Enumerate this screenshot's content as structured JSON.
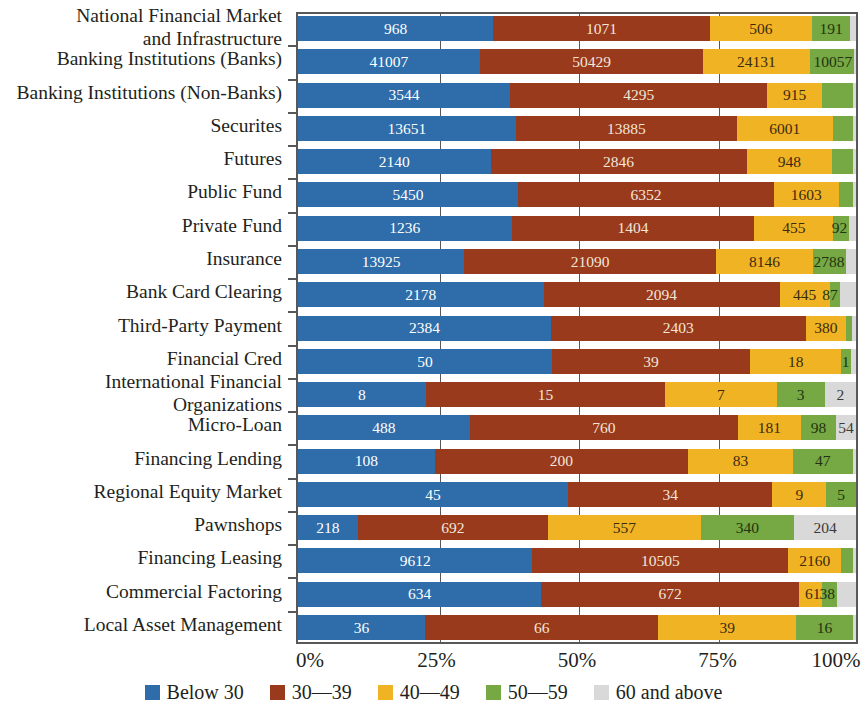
{
  "chart_data": {
    "type": "bar",
    "orientation": "horizontal",
    "stacked": true,
    "normalized": true,
    "title": "",
    "xlabel": "",
    "ylabel": "",
    "xlim": [
      0,
      100
    ],
    "xticks": [
      "0%",
      "25%",
      "50%",
      "75%",
      "100%"
    ],
    "xtick_values": [
      0,
      25,
      50,
      75,
      100
    ],
    "grid": true,
    "legend_position": "bottom",
    "legend": [
      "Below 30",
      "30—39",
      "40—49",
      "50—59",
      "60 and above"
    ],
    "colors": [
      "#2e6daa",
      "#983a1b",
      "#f0b323",
      "#76a943",
      "#d9d9d9"
    ],
    "categories": [
      "National Financial Market and Infrastructure",
      "Banking Institutions (Banks)",
      "Banking Institutions (Non-Banks)",
      "Securites",
      "Futures",
      "Public Fund",
      "Private Fund",
      "Insurance",
      "Bank Card Clearing",
      "Third-Party Payment",
      "Financial Cred",
      "International Financial Organizations",
      "Micro-Loan",
      "Financing Lending",
      "Regional Equity Market",
      "Pawnshops",
      "Financing Leasing",
      "Commercial Factoring",
      "Local Asset Management"
    ],
    "series": [
      {
        "name": "Below 30",
        "color": "#2e6daa",
        "values": [
          968,
          41007,
          3544,
          13651,
          2140,
          5450,
          1236,
          13925,
          2178,
          2384,
          50,
          8,
          488,
          108,
          45,
          218,
          9612,
          634,
          36
        ]
      },
      {
        "name": "30—39",
        "color": "#983a1b",
        "values": [
          1071,
          50429,
          4295,
          13885,
          2846,
          6352,
          1404,
          21090,
          2094,
          2403,
          39,
          15,
          760,
          200,
          34,
          692,
          10505,
          672,
          66
        ]
      },
      {
        "name": "40—49",
        "color": "#f0b323",
        "values": [
          506,
          24131,
          915,
          6001,
          948,
          1603,
          455,
          8146,
          445,
          380,
          18,
          7,
          181,
          83,
          9,
          557,
          2160,
          61,
          39
        ]
      },
      {
        "name": "50—59",
        "color": "#76a943",
        "values": [
          191,
          10057,
          230,
          1100,
          150,
          180,
          92,
          2788,
          87,
          60,
          1,
          3,
          98,
          47,
          5,
          340,
          280,
          38,
          16
        ]
      },
      {
        "name": "60 and above",
        "color": "#d9d9d9",
        "values": [
          0,
          0,
          0,
          0,
          0,
          0,
          40,
          0,
          0,
          0,
          0,
          2,
          54,
          0,
          0,
          204,
          0,
          8,
          0
        ]
      }
    ],
    "rows": [
      {
        "label_lines": [
          "National Financial Market",
          "and Infrastructure"
        ],
        "segments": [
          {
            "pct": 35.0,
            "label": "968",
            "cls": "s0"
          },
          {
            "pct": 38.8,
            "label": "1071",
            "cls": "s1"
          },
          {
            "pct": 18.3,
            "label": "506",
            "cls": "s2"
          },
          {
            "pct": 6.9,
            "label": "191",
            "cls": "s3"
          },
          {
            "pct": 1.0,
            "label": "",
            "cls": "s4"
          }
        ]
      },
      {
        "label_lines": [
          "Banking Institutions (Banks)"
        ],
        "segments": [
          {
            "pct": 32.6,
            "label": "41007",
            "cls": "s0"
          },
          {
            "pct": 40.0,
            "label": "50429",
            "cls": "s1"
          },
          {
            "pct": 19.1,
            "label": "24131",
            "cls": "s2"
          },
          {
            "pct": 8.0,
            "label": "10057",
            "cls": "s3",
            "outside": true
          },
          {
            "pct": 0.3,
            "label": "",
            "cls": "s4"
          }
        ]
      },
      {
        "label_lines": [
          "Banking Institutions (Non-Banks)"
        ],
        "segments": [
          {
            "pct": 38.0,
            "label": "3544",
            "cls": "s0"
          },
          {
            "pct": 46.1,
            "label": "4295",
            "cls": "s1"
          },
          {
            "pct": 9.8,
            "label": "915",
            "cls": "s2"
          },
          {
            "pct": 5.6,
            "label": "",
            "cls": "s3"
          },
          {
            "pct": 0.5,
            "label": "",
            "cls": "s4"
          }
        ]
      },
      {
        "label_lines": [
          "Securites"
        ],
        "segments": [
          {
            "pct": 39.0,
            "label": "13651",
            "cls": "s0"
          },
          {
            "pct": 39.7,
            "label": "13885",
            "cls": "s1"
          },
          {
            "pct": 17.1,
            "label": "6001",
            "cls": "s2"
          },
          {
            "pct": 3.7,
            "label": "",
            "cls": "s3"
          },
          {
            "pct": 0.5,
            "label": "",
            "cls": "s4"
          }
        ]
      },
      {
        "label_lines": [
          "Futures"
        ],
        "segments": [
          {
            "pct": 34.5,
            "label": "2140",
            "cls": "s0"
          },
          {
            "pct": 45.9,
            "label": "2846",
            "cls": "s1"
          },
          {
            "pct": 15.3,
            "label": "948",
            "cls": "s2"
          },
          {
            "pct": 3.8,
            "label": "",
            "cls": "s3"
          },
          {
            "pct": 0.5,
            "label": "",
            "cls": "s4"
          }
        ]
      },
      {
        "label_lines": [
          "Public Fund"
        ],
        "segments": [
          {
            "pct": 39.4,
            "label": "5450",
            "cls": "s0"
          },
          {
            "pct": 45.9,
            "label": "6352",
            "cls": "s1"
          },
          {
            "pct": 11.6,
            "label": "1603",
            "cls": "s2"
          },
          {
            "pct": 2.6,
            "label": "",
            "cls": "s3"
          },
          {
            "pct": 0.5,
            "label": "",
            "cls": "s4"
          }
        ]
      },
      {
        "label_lines": [
          "Private Fund"
        ],
        "segments": [
          {
            "pct": 38.3,
            "label": "1236",
            "cls": "s0"
          },
          {
            "pct": 43.5,
            "label": "1404",
            "cls": "s1"
          },
          {
            "pct": 14.1,
            "label": "455",
            "cls": "s2"
          },
          {
            "pct": 2.9,
            "label": "92",
            "cls": "s3",
            "outside": true
          },
          {
            "pct": 1.2,
            "label": "",
            "cls": "s4"
          }
        ]
      },
      {
        "label_lines": [
          "Insurance"
        ],
        "segments": [
          {
            "pct": 29.8,
            "label": "13925",
            "cls": "s0"
          },
          {
            "pct": 45.1,
            "label": "21090",
            "cls": "s1"
          },
          {
            "pct": 17.4,
            "label": "8146",
            "cls": "s2"
          },
          {
            "pct": 6.0,
            "label": "2788",
            "cls": "s3",
            "outside": true
          },
          {
            "pct": 1.7,
            "label": "",
            "cls": "s4"
          }
        ]
      },
      {
        "label_lines": [
          "Bank Card Clearing"
        ],
        "segments": [
          {
            "pct": 44.0,
            "label": "2178",
            "cls": "s0"
          },
          {
            "pct": 42.3,
            "label": "2094",
            "cls": "s1"
          },
          {
            "pct": 9.0,
            "label": "445",
            "cls": "s2"
          },
          {
            "pct": 1.8,
            "label": "87",
            "cls": "s3",
            "outside": true
          },
          {
            "pct": 2.9,
            "label": "",
            "cls": "s4"
          }
        ]
      },
      {
        "label_lines": [
          "Third-Party Payment"
        ],
        "segments": [
          {
            "pct": 45.3,
            "label": "2384",
            "cls": "s0"
          },
          {
            "pct": 45.7,
            "label": "2403",
            "cls": "s1"
          },
          {
            "pct": 7.2,
            "label": "380",
            "cls": "s2"
          },
          {
            "pct": 1.1,
            "label": "",
            "cls": "s3"
          },
          {
            "pct": 0.7,
            "label": "",
            "cls": "s4"
          }
        ]
      },
      {
        "label_lines": [
          "Financial Cred"
        ],
        "segments": [
          {
            "pct": 45.5,
            "label": "50",
            "cls": "s0"
          },
          {
            "pct": 35.5,
            "label": "39",
            "cls": "s1"
          },
          {
            "pct": 16.4,
            "label": "18",
            "cls": "s2"
          },
          {
            "pct": 1.8,
            "label": "1",
            "cls": "s3",
            "outside": true
          },
          {
            "pct": 0.8,
            "label": "",
            "cls": "s4"
          }
        ]
      },
      {
        "label_lines": [
          "International Financial",
          "Organizations"
        ],
        "segments": [
          {
            "pct": 22.9,
            "label": "8",
            "cls": "s0"
          },
          {
            "pct": 42.9,
            "label": "15",
            "cls": "s1"
          },
          {
            "pct": 20.0,
            "label": "7",
            "cls": "s2"
          },
          {
            "pct": 8.6,
            "label": "3",
            "cls": "s3"
          },
          {
            "pct": 5.6,
            "label": "2",
            "cls": "s4"
          }
        ]
      },
      {
        "label_lines": [
          "Micro-Loan"
        ],
        "segments": [
          {
            "pct": 30.8,
            "label": "488",
            "cls": "s0"
          },
          {
            "pct": 48.0,
            "label": "760",
            "cls": "s1"
          },
          {
            "pct": 11.4,
            "label": "181",
            "cls": "s2"
          },
          {
            "pct": 6.2,
            "label": "98",
            "cls": "s3"
          },
          {
            "pct": 3.6,
            "label": "54",
            "cls": "s4"
          }
        ]
      },
      {
        "label_lines": [
          "Financing Lending"
        ],
        "segments": [
          {
            "pct": 24.5,
            "label": "108",
            "cls": "s0"
          },
          {
            "pct": 45.4,
            "label": "200",
            "cls": "s1"
          },
          {
            "pct": 18.8,
            "label": "83",
            "cls": "s2"
          },
          {
            "pct": 10.7,
            "label": "47",
            "cls": "s3"
          },
          {
            "pct": 0.6,
            "label": "",
            "cls": "s4"
          }
        ]
      },
      {
        "label_lines": [
          "Regional Equity Market"
        ],
        "segments": [
          {
            "pct": 48.4,
            "label": "45",
            "cls": "s0"
          },
          {
            "pct": 36.6,
            "label": "34",
            "cls": "s1"
          },
          {
            "pct": 9.7,
            "label": "9",
            "cls": "s2"
          },
          {
            "pct": 5.3,
            "label": "5",
            "cls": "s3"
          },
          {
            "pct": 0.0,
            "label": "",
            "cls": "s4"
          }
        ]
      },
      {
        "label_lines": [
          "Pawnshops"
        ],
        "segments": [
          {
            "pct": 10.7,
            "label": "218",
            "cls": "s0"
          },
          {
            "pct": 34.1,
            "label": "692",
            "cls": "s1"
          },
          {
            "pct": 27.4,
            "label": "557",
            "cls": "s2"
          },
          {
            "pct": 16.7,
            "label": "340",
            "cls": "s3"
          },
          {
            "pct": 11.1,
            "label": "204",
            "cls": "s4"
          }
        ]
      },
      {
        "label_lines": [
          "Financing Leasing"
        ],
        "segments": [
          {
            "pct": 42.0,
            "label": "9612",
            "cls": "s0"
          },
          {
            "pct": 45.9,
            "label": "10505",
            "cls": "s1"
          },
          {
            "pct": 9.4,
            "label": "2160",
            "cls": "s2"
          },
          {
            "pct": 2.2,
            "label": "",
            "cls": "s3"
          },
          {
            "pct": 0.5,
            "label": "",
            "cls": "s4"
          }
        ]
      },
      {
        "label_lines": [
          "Commercial Factoring"
        ],
        "segments": [
          {
            "pct": 43.6,
            "label": "634",
            "cls": "s0"
          },
          {
            "pct": 46.2,
            "label": "672",
            "cls": "s1"
          },
          {
            "pct": 4.2,
            "label": "61",
            "cls": "s2",
            "outside": true
          },
          {
            "pct": 2.6,
            "label": "38",
            "cls": "s3",
            "outside": true
          },
          {
            "pct": 3.4,
            "label": "",
            "cls": "s4"
          }
        ]
      },
      {
        "label_lines": [
          "Local Asset Management"
        ],
        "segments": [
          {
            "pct": 22.8,
            "label": "36",
            "cls": "s0"
          },
          {
            "pct": 41.8,
            "label": "66",
            "cls": "s1"
          },
          {
            "pct": 24.7,
            "label": "39",
            "cls": "s2"
          },
          {
            "pct": 10.1,
            "label": "16",
            "cls": "s3"
          },
          {
            "pct": 0.6,
            "label": "",
            "cls": "s4"
          }
        ]
      }
    ]
  }
}
